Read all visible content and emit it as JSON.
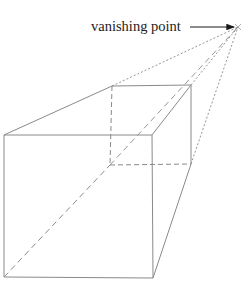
{
  "figure": {
    "type": "one-point perspective cube drawing",
    "label": "vanishing point",
    "colors": {
      "line": "#8a8a8a",
      "text": "#222222",
      "arrow": "#1a1a1a",
      "background": "#ffffff"
    },
    "points": {
      "vanishing_point": [
        238,
        27
      ],
      "front_top_left": [
        4,
        135
      ],
      "front_top_right": [
        152,
        135
      ],
      "front_bottom_left": [
        4,
        277
      ],
      "front_bottom_right": [
        153,
        278
      ],
      "back_top_left": [
        112,
        86
      ],
      "back_top_right": [
        191,
        85
      ],
      "back_bottom_left": [
        110,
        165
      ],
      "back_bottom_right": [
        191,
        164
      ]
    }
  }
}
